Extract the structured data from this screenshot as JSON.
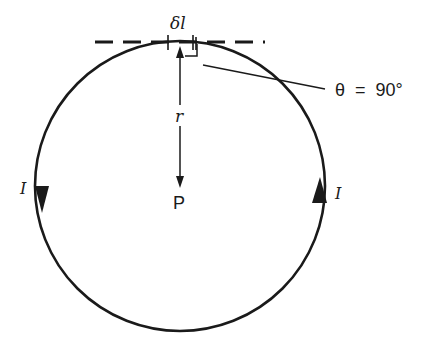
{
  "diagram": {
    "title": "",
    "colors": {
      "stroke": "#1a1a1a",
      "background": "#ffffff"
    },
    "loop": {
      "center_x": 180,
      "center_y": 186,
      "radius": 145
    },
    "labels": {
      "element": "δl",
      "radius": "r",
      "point": "P",
      "current_left": "I",
      "current_right": "I",
      "angle": "θ  =  90°"
    }
  }
}
